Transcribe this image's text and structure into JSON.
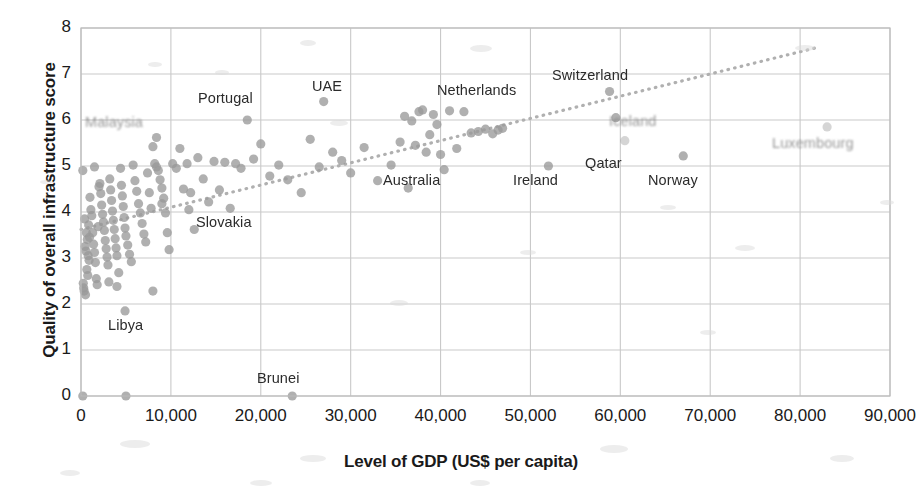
{
  "chart_data": {
    "type": "scatter",
    "title": "",
    "xlabel": "Level of GDP (US$ per capita)",
    "ylabel": "Quality of overall infrastructure score",
    "xlim": [
      0,
      90000
    ],
    "ylim": [
      0,
      8
    ],
    "xticks": [
      0,
      10000,
      20000,
      30000,
      40000,
      50000,
      60000,
      70000,
      80000,
      90000
    ],
    "xtick_labels": [
      "0",
      "10,000",
      "20,000",
      "30,000",
      "40,000",
      "50,000",
      "60,000",
      "70,000",
      "80,000",
      "90,000"
    ],
    "yticks": [
      0,
      1,
      2,
      3,
      4,
      5,
      6,
      7,
      8
    ],
    "ytick_labels": [
      "0",
      "1",
      "2",
      "3",
      "4",
      "5",
      "6",
      "7",
      "8"
    ],
    "grid": true,
    "legend": false,
    "point_color": "#9a9a9a",
    "trendline": {
      "style": "dotted",
      "color": "#b0b0b0",
      "x_start": 0,
      "y_start": 3.62,
      "x_end": 82000,
      "y_end": 7.58
    },
    "points": [
      [
        200,
        4.9
      ],
      [
        400,
        3.85
      ],
      [
        300,
        2.35
      ],
      [
        350,
        2.28
      ],
      [
        500,
        2.2
      ],
      [
        250,
        2.45
      ],
      [
        600,
        3.55
      ],
      [
        700,
        3.4
      ],
      [
        800,
        3.05
      ],
      [
        900,
        2.95
      ],
      [
        450,
        3.25
      ],
      [
        550,
        3.15
      ],
      [
        650,
        2.75
      ],
      [
        750,
        2.62
      ],
      [
        850,
        3.72
      ],
      [
        950,
        3.45
      ],
      [
        1000,
        4.32
      ],
      [
        1100,
        4.05
      ],
      [
        1200,
        3.92
      ],
      [
        1300,
        3.55
      ],
      [
        1400,
        3.3
      ],
      [
        1500,
        3.12
      ],
      [
        1600,
        2.9
      ],
      [
        1700,
        2.55
      ],
      [
        1800,
        2.42
      ],
      [
        1900,
        3.68
      ],
      [
        2000,
        4.55
      ],
      [
        2100,
        4.62
      ],
      [
        2200,
        4.4
      ],
      [
        2300,
        4.15
      ],
      [
        2400,
        3.95
      ],
      [
        2500,
        3.78
      ],
      [
        2600,
        3.6
      ],
      [
        2700,
        3.38
      ],
      [
        2800,
        3.2
      ],
      [
        2900,
        3.02
      ],
      [
        3000,
        2.85
      ],
      [
        3100,
        2.48
      ],
      [
        3200,
        4.72
      ],
      [
        3300,
        4.48
      ],
      [
        3400,
        4.25
      ],
      [
        3500,
        4.02
      ],
      [
        3600,
        3.82
      ],
      [
        3700,
        3.62
      ],
      [
        3800,
        3.42
      ],
      [
        3900,
        3.22
      ],
      [
        4000,
        3.05
      ],
      [
        4200,
        2.68
      ],
      [
        4400,
        4.95
      ],
      [
        4500,
        4.58
      ],
      [
        4600,
        4.35
      ],
      [
        4700,
        4.12
      ],
      [
        4800,
        3.88
      ],
      [
        4900,
        3.65
      ],
      [
        5000,
        3.48
      ],
      [
        5200,
        3.28
      ],
      [
        5400,
        3.08
      ],
      [
        5600,
        2.92
      ],
      [
        5800,
        5.02
      ],
      [
        6000,
        4.68
      ],
      [
        6200,
        4.45
      ],
      [
        6400,
        4.18
      ],
      [
        6600,
        3.98
      ],
      [
        6800,
        3.75
      ],
      [
        7000,
        3.52
      ],
      [
        7200,
        3.35
      ],
      [
        7400,
        4.85
      ],
      [
        7600,
        4.42
      ],
      [
        7800,
        4.08
      ],
      [
        8000,
        5.42
      ],
      [
        8200,
        5.05
      ],
      [
        8400,
        4.98
      ],
      [
        8600,
        4.9
      ],
      [
        8800,
        4.7
      ],
      [
        9000,
        4.52
      ],
      [
        9200,
        4.3
      ],
      [
        9400,
        3.98
      ],
      [
        9600,
        3.55
      ],
      [
        9800,
        3.18
      ],
      [
        10200,
        5.05
      ],
      [
        10600,
        4.95
      ],
      [
        11000,
        5.38
      ],
      [
        11400,
        4.5
      ],
      [
        11800,
        5.05
      ],
      [
        12200,
        4.42
      ],
      [
        12600,
        3.62
      ],
      [
        13000,
        5.18
      ],
      [
        13600,
        4.72
      ],
      [
        14200,
        4.22
      ],
      [
        14800,
        5.1
      ],
      [
        15400,
        4.48
      ],
      [
        16000,
        5.08
      ],
      [
        16600,
        4.08
      ],
      [
        17200,
        5.05
      ],
      [
        17800,
        4.95
      ],
      [
        18500,
        6.0
      ],
      [
        19200,
        5.15
      ],
      [
        20000,
        5.48
      ],
      [
        21000,
        4.78
      ],
      [
        22000,
        5.02
      ],
      [
        23000,
        4.7
      ],
      [
        23500,
        0.0
      ],
      [
        24500,
        4.42
      ],
      [
        25500,
        5.58
      ],
      [
        26500,
        4.98
      ],
      [
        27000,
        6.4
      ],
      [
        28000,
        5.3
      ],
      [
        29000,
        5.12
      ],
      [
        30000,
        4.85
      ],
      [
        31500,
        5.4
      ],
      [
        33000,
        4.68
      ],
      [
        34500,
        5.02
      ],
      [
        35500,
        5.52
      ],
      [
        36000,
        6.08
      ],
      [
        36400,
        4.52
      ],
      [
        36800,
        5.98
      ],
      [
        37200,
        5.45
      ],
      [
        37600,
        6.18
      ],
      [
        38000,
        6.22
      ],
      [
        38400,
        5.3
      ],
      [
        38800,
        5.68
      ],
      [
        39200,
        6.12
      ],
      [
        39600,
        5.9
      ],
      [
        40000,
        5.25
      ],
      [
        40400,
        4.92
      ],
      [
        41000,
        6.2
      ],
      [
        41800,
        5.38
      ],
      [
        42600,
        6.18
      ],
      [
        43400,
        5.72
      ],
      [
        44200,
        5.75
      ],
      [
        45000,
        5.8
      ],
      [
        45800,
        5.7
      ],
      [
        46400,
        5.78
      ],
      [
        46900,
        5.82
      ],
      [
        52000,
        5.0
      ],
      [
        58800,
        6.62
      ],
      [
        59500,
        6.05
      ],
      [
        60500,
        5.55
      ],
      [
        67000,
        5.22
      ],
      [
        83000,
        5.85
      ],
      [
        200,
        0.0
      ],
      [
        5000,
        0.0
      ],
      [
        4900,
        1.85
      ],
      [
        4000,
        2.38
      ],
      [
        8400,
        5.62
      ],
      [
        8000,
        2.28
      ],
      [
        9000,
        4.18
      ],
      [
        12000,
        4.05
      ],
      [
        1500,
        4.98
      ]
    ],
    "annotations": [
      {
        "text": "Malaysia",
        "x_px": 85,
        "y_px": 114,
        "degraded": "strong"
      },
      {
        "text": "Portugal",
        "x_px": 198,
        "y_px": 90,
        "degraded": "none"
      },
      {
        "text": "UAE",
        "x_px": 312,
        "y_px": 78,
        "degraded": "none"
      },
      {
        "text": "Netherlands",
        "x_px": 437,
        "y_px": 82,
        "degraded": "none"
      },
      {
        "text": "Switzerland",
        "x_px": 552,
        "y_px": 67,
        "degraded": "none"
      },
      {
        "text": "Iceland",
        "x_px": 609,
        "y_px": 113,
        "degraded": "strong"
      },
      {
        "text": "Luxembourg",
        "x_px": 772,
        "y_px": 135,
        "degraded": "strong"
      },
      {
        "text": "Australia",
        "x_px": 383,
        "y_px": 172,
        "degraded": "none"
      },
      {
        "text": "Ireland",
        "x_px": 513,
        "y_px": 172,
        "degraded": "none"
      },
      {
        "text": "Qatar",
        "x_px": 585,
        "y_px": 155,
        "degraded": "none"
      },
      {
        "text": "Norway",
        "x_px": 648,
        "y_px": 172,
        "degraded": "none"
      },
      {
        "text": "Slovakia",
        "x_px": 196,
        "y_px": 214,
        "degraded": "none"
      },
      {
        "text": "Libya",
        "x_px": 108,
        "y_px": 317,
        "degraded": "none"
      },
      {
        "text": "Brunei",
        "x_px": 257,
        "y_px": 370,
        "degraded": "none"
      }
    ]
  }
}
